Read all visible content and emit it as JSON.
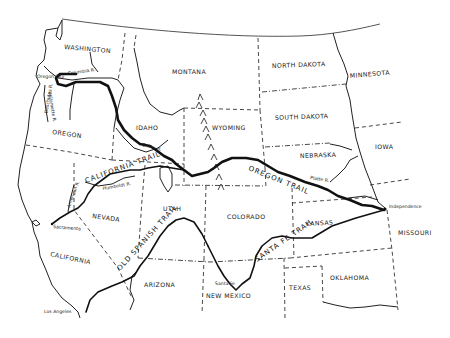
{
  "map": {
    "title": "Western Trails Map",
    "states": [
      {
        "id": "washington",
        "label": "WASHINGTON",
        "x": 64,
        "y": 47,
        "rot": 5
      },
      {
        "id": "oregon",
        "label": "OREGON",
        "x": 56,
        "y": 134,
        "rot": 8
      },
      {
        "id": "california",
        "label": "CALIFORNIA",
        "x": 52,
        "y": 254,
        "rot": 10
      },
      {
        "id": "nevada",
        "label": "NEVADA",
        "x": 92,
        "y": 218,
        "rot": 8
      },
      {
        "id": "idaho",
        "label": "IDAHO",
        "x": 137,
        "y": 129,
        "rot": 0
      },
      {
        "id": "montana",
        "label": "MONTANA",
        "x": 173,
        "y": 73,
        "rot": 0
      },
      {
        "id": "wyoming",
        "label": "WYOMING",
        "x": 212,
        "y": 129,
        "rot": 0
      },
      {
        "id": "utah",
        "label": "UTAH",
        "x": 164,
        "y": 210,
        "rot": 0
      },
      {
        "id": "colorado",
        "label": "COLORADO",
        "x": 227,
        "y": 218,
        "rot": 0
      },
      {
        "id": "arizona",
        "label": "ARIZONA",
        "x": 145,
        "y": 286,
        "rot": 0
      },
      {
        "id": "new-mexico",
        "label": "NEW MEXICO",
        "x": 206,
        "y": 298,
        "rot": 0
      },
      {
        "id": "north-dakota",
        "label": "NORTH DAKOTA",
        "x": 273,
        "y": 67,
        "rot": -2
      },
      {
        "id": "south-dakota",
        "label": "SOUTH DAKOTA",
        "x": 276,
        "y": 119,
        "rot": -2
      },
      {
        "id": "nebraska",
        "label": "NEBRASKA",
        "x": 300,
        "y": 157,
        "rot": -2
      },
      {
        "id": "minnesota",
        "label": "MINNESOTA",
        "x": 350,
        "y": 76,
        "rot": -5
      },
      {
        "id": "iowa",
        "label": "IOWA",
        "x": 375,
        "y": 148,
        "rot": 0
      },
      {
        "id": "kansas",
        "label": "KANSAS",
        "x": 306,
        "y": 226,
        "rot": -3
      },
      {
        "id": "missouri",
        "label": "MISSOURI",
        "x": 398,
        "y": 235,
        "rot": 0
      },
      {
        "id": "oklahoma",
        "label": "OKLAHOMA",
        "x": 330,
        "y": 280,
        "rot": 0
      },
      {
        "id": "texas",
        "label": "TEXAS",
        "x": 289,
        "y": 290,
        "rot": 0
      }
    ],
    "trails": [
      {
        "id": "oregon-trail",
        "label": "OREGON TRAIL"
      },
      {
        "id": "california-trail",
        "label": "CALIFORNIA TRAIL"
      },
      {
        "id": "santa-fe-trail",
        "label": "SANTA FE TRAIL"
      },
      {
        "id": "old-spanish-trail",
        "label": "OLD SPANISH TRAIL"
      }
    ],
    "places": [
      {
        "id": "independence",
        "label": "Independence",
        "x": 390,
        "y": 208
      },
      {
        "id": "sacramento",
        "label": "Sacramento",
        "x": 50,
        "y": 226
      },
      {
        "id": "los-angeles",
        "label": "Los Angeles",
        "x": 44,
        "y": 314
      },
      {
        "id": "santa-fe",
        "label": "Santa Fe",
        "x": 219,
        "y": 285
      },
      {
        "id": "great-salt-lake",
        "label": "Great Salt Lake",
        "x": 153,
        "y": 176
      }
    ],
    "rivers": [
      {
        "id": "columbia-river",
        "label": "Columbia R.",
        "x": 67,
        "y": 76
      },
      {
        "id": "platte-river",
        "label": "Platte R.",
        "x": 312,
        "y": 180
      },
      {
        "id": "snake-river",
        "label": "Snake R.",
        "x": 143,
        "y": 148
      },
      {
        "id": "humboldt-river",
        "label": "Humboldt R.",
        "x": 105,
        "y": 188
      },
      {
        "id": "willamette-river",
        "label": "Willamette R.",
        "x": 46,
        "y": 105
      },
      {
        "id": "deschutes-river",
        "label": "Deschutes R.",
        "x": 74,
        "y": 105
      },
      {
        "id": "american-river",
        "label": "American R.",
        "x": 75,
        "y": 200
      },
      {
        "id": "oregon-city",
        "label": "Oregon City",
        "x": 41,
        "y": 78
      }
    ],
    "colors": {
      "ink": "#111111",
      "paper": "#ffffff"
    }
  }
}
